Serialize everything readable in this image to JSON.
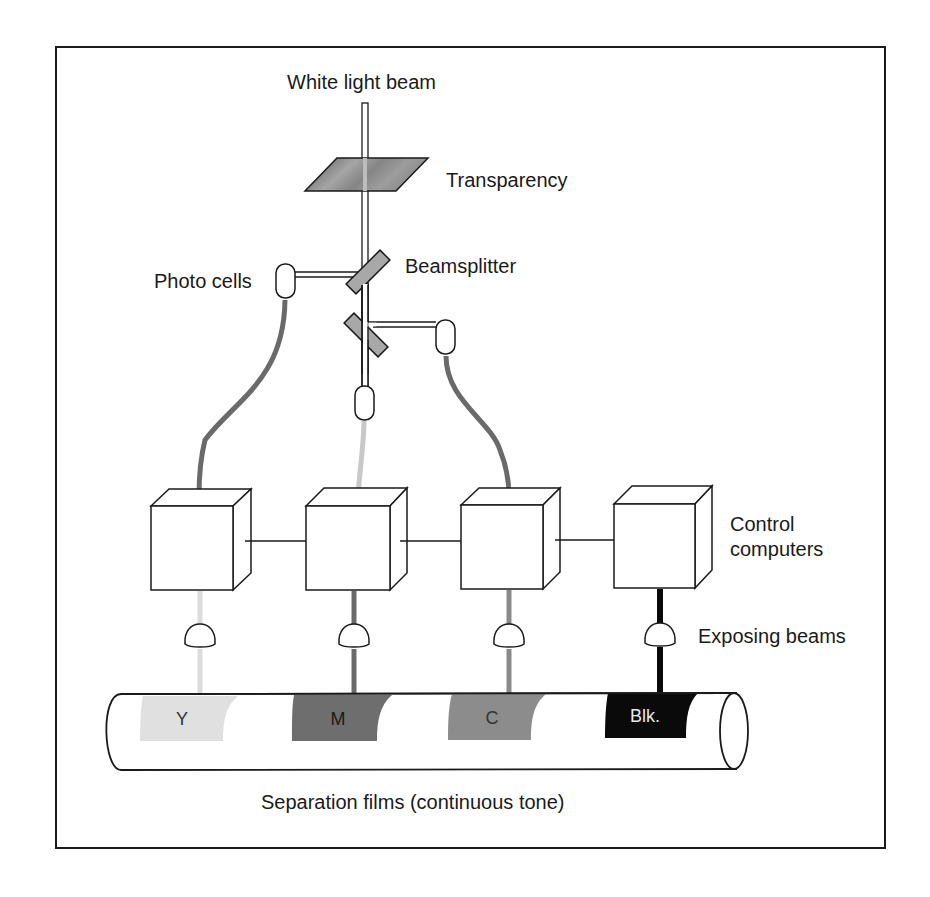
{
  "diagram": {
    "labels": {
      "white_light_beam": "White light beam",
      "transparency": "Transparency",
      "beamsplitter": "Beamsplitter",
      "photo_cells": "Photo cells",
      "control_computers_line1": "Control",
      "control_computers_line2": "computers",
      "exposing_beams": "Exposing beams",
      "separation_films": "Separation films  (continuous tone)"
    },
    "channels": [
      {
        "id": "yellow",
        "label": "Y",
        "color": "#e0e0e0",
        "text_color": "#333333"
      },
      {
        "id": "magenta",
        "label": "M",
        "color": "#6e6e6e",
        "text_color": "#1a1a1a"
      },
      {
        "id": "cyan",
        "label": "C",
        "color": "#8c8c8c",
        "text_color": "#333333"
      },
      {
        "id": "black",
        "label": "Blk.",
        "color": "#0a0a0a",
        "text_color": "#e8e8e8"
      }
    ],
    "colors": {
      "line": "#1a1a1a",
      "cable_dark": "#6a6a6a",
      "cable_light": "#c8c8c8",
      "mirror": "#a8a8a8",
      "transparency": "#8a8a8a"
    }
  }
}
